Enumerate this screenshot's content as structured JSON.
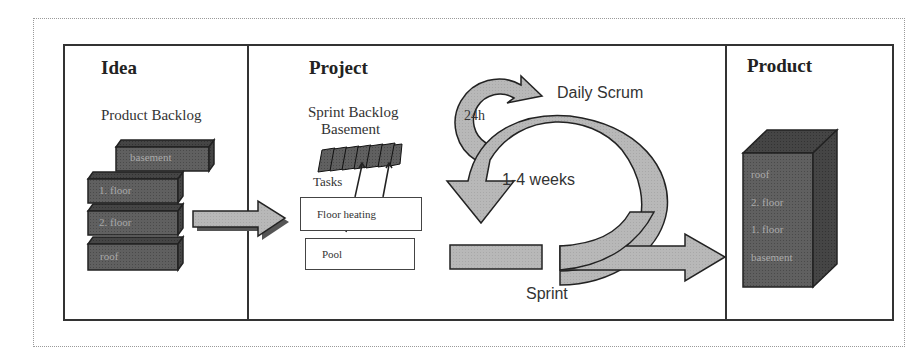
{
  "sections": {
    "idea": {
      "title": "Idea",
      "subtitle": "Product Backlog",
      "bricks": [
        "basement",
        "1. floor",
        "2. floor",
        "roof"
      ]
    },
    "project": {
      "title": "Project",
      "sprint_backlog": "Sprint Backlog",
      "sprint_backlog_item": "Basement",
      "tasks_label": "Tasks",
      "tasks": [
        "Floor heating",
        "Pool"
      ],
      "daily_scrum": "Daily Scrum",
      "daily_cycle": "24h",
      "sprint_cycle": "1-4 weeks",
      "sprint": "Sprint"
    },
    "product": {
      "title": "Product",
      "floors": [
        "roof",
        "2. floor",
        "1. floor",
        "basement"
      ]
    }
  },
  "colors": {
    "frame": "#333333",
    "brick": "#5e5e5e",
    "arrow": "#b5b5b5",
    "outline": "#222222"
  }
}
